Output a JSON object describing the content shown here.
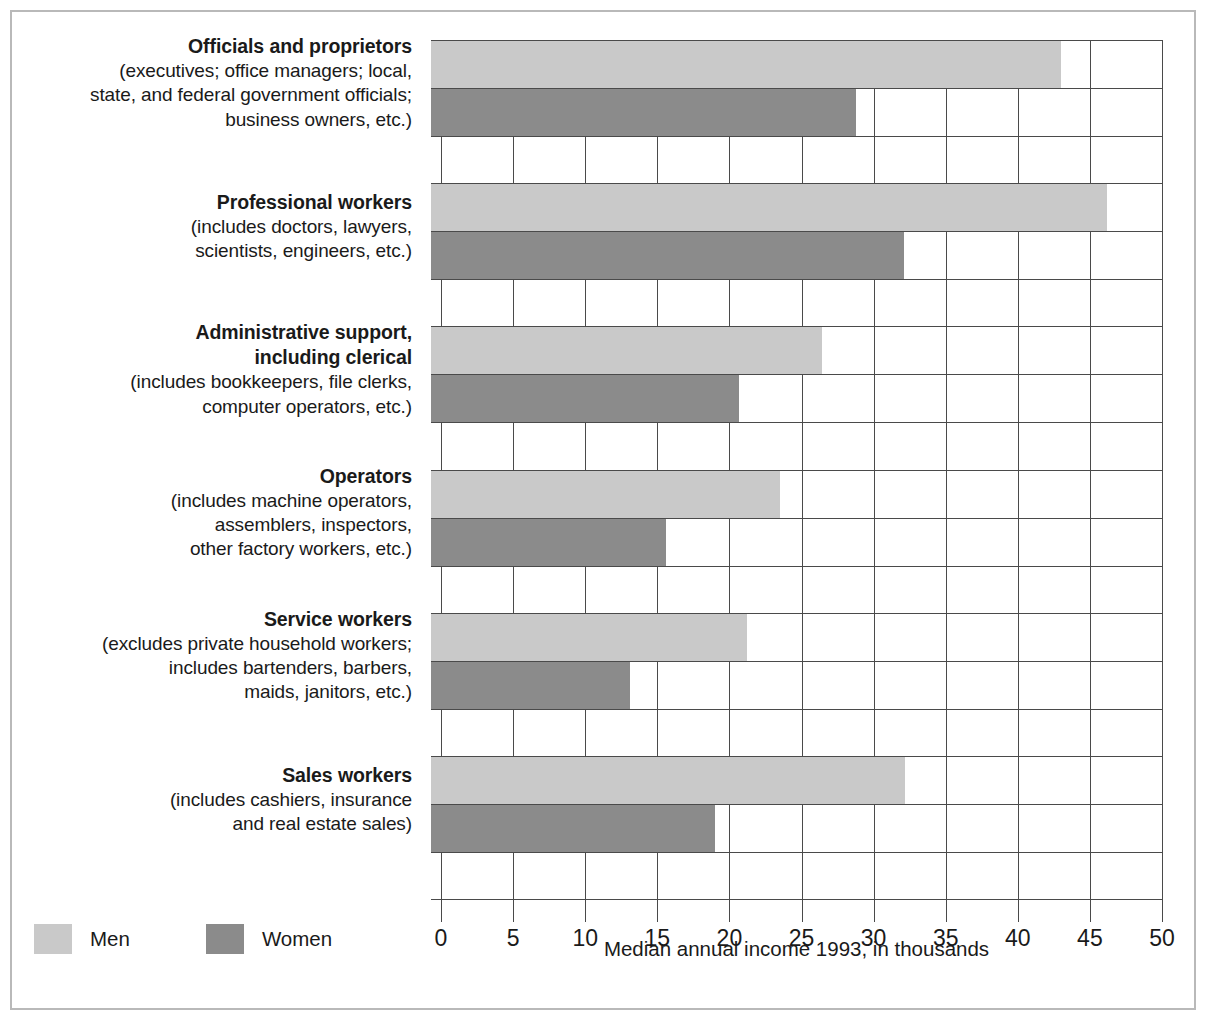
{
  "chart_data": {
    "type": "bar",
    "orientation": "horizontal",
    "title": "",
    "xlabel": "Median annual income 1993, in thousands",
    "ylabel": "",
    "xlim": [
      0,
      50
    ],
    "xticks": [
      0,
      5,
      10,
      15,
      20,
      25,
      30,
      35,
      40,
      45,
      50
    ],
    "xtick_labels": [
      "0",
      "5",
      "10",
      "15",
      "20",
      "25",
      "30",
      "35",
      "40",
      "45",
      "50"
    ],
    "grid": true,
    "legend_position": "bottom-left",
    "categories": [
      "Officials and proprietors",
      "Professional workers",
      "Administrative support, including clerical",
      "Operators",
      "Service workers",
      "Sales workers"
    ],
    "series": [
      {
        "name": "Men",
        "color": "#c9c9c9",
        "values": [
          43.0,
          46.2,
          26.4,
          23.5,
          21.2,
          32.2
        ]
      },
      {
        "name": "Women",
        "color": "#8b8b8b",
        "values": [
          28.8,
          32.1,
          20.7,
          15.6,
          13.1,
          19.0
        ]
      }
    ]
  },
  "categories": [
    {
      "title": "Officials and proprietors",
      "sublines": [
        "(executives; office managers; local,",
        "state, and federal government officials;",
        "business owners, etc.)"
      ],
      "men": 43.0,
      "women": 28.8
    },
    {
      "title": "Professional workers",
      "sublines": [
        "(includes doctors, lawyers,",
        "scientists, engineers, etc.)"
      ],
      "men": 46.2,
      "women": 32.1
    },
    {
      "title": "Administrative support,",
      "title2": "including clerical",
      "sublines": [
        "(includes bookkeepers, file clerks,",
        "computer operators, etc.)"
      ],
      "men": 26.4,
      "women": 20.7
    },
    {
      "title": "Operators",
      "sublines": [
        "(includes machine operators,",
        "assemblers, inspectors,",
        "other factory workers, etc.)"
      ],
      "men": 23.5,
      "women": 15.6
    },
    {
      "title": "Service workers",
      "sublines": [
        "(excludes private household workers;",
        "includes bartenders, barbers,",
        "maids, janitors, etc.)"
      ],
      "men": 21.2,
      "women": 13.1
    },
    {
      "title": "Sales workers",
      "sublines": [
        "(includes cashiers, insurance",
        "and real estate sales)"
      ],
      "men": 32.2,
      "women": 19.0
    }
  ],
  "axis": {
    "title": "Median annual income 1993, in thousands",
    "ticks": [
      "0",
      "5",
      "10",
      "15",
      "20",
      "25",
      "30",
      "35",
      "40",
      "45",
      "50"
    ]
  },
  "legend": {
    "items": [
      {
        "label": "Men",
        "color": "#c9c9c9"
      },
      {
        "label": "Women",
        "color": "#8b8b8b"
      }
    ]
  },
  "colors": {
    "men_bar": "#c9c9c9",
    "women_bar": "#8b8b8b",
    "gridline": "#4a4a4a",
    "frame": "#b9b9b9",
    "text": "#1a1a1a"
  }
}
